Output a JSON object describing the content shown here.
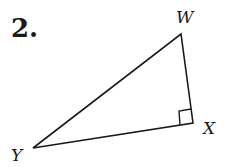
{
  "problem": {
    "number": "2."
  },
  "triangle": {
    "vertices": {
      "W": {
        "label": "W",
        "x": 181,
        "y": 34
      },
      "X": {
        "label": "X",
        "x": 193,
        "y": 123
      },
      "Y": {
        "label": "Y",
        "x": 33,
        "y": 148
      }
    },
    "right_angle_at": "X",
    "stroke_color": "#1a1a1a"
  }
}
